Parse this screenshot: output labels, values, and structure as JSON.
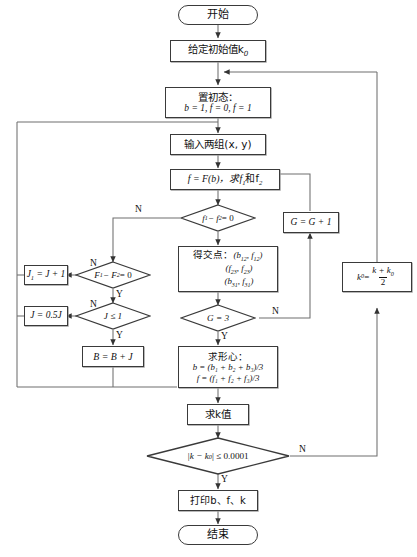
{
  "diagram": {
    "language": "zh-CN",
    "nodes": {
      "start": {
        "label": "开始",
        "shape": "terminator"
      },
      "init_k0": {
        "label": "给定初始值k",
        "sub": "0",
        "shape": "process"
      },
      "init_state_line1": {
        "label": "置初态："
      },
      "init_state_line2": {
        "b": "b = 1",
        "f0": "f = 0",
        "f1": "f = 1"
      },
      "input_pairs": {
        "label": "输入两组(x, y)",
        "shape": "process"
      },
      "calc_f": {
        "label": "f = F(b)，求f",
        "sub1": "1",
        "mid": "和f",
        "sub2": "2",
        "shape": "process"
      },
      "dec_f_diff": {
        "label": "f",
        "sub1": "1",
        "minus": " − f",
        "sub2": "2",
        "tail": " = 0",
        "shape": "decision"
      },
      "dec_F_diff": {
        "label": "F",
        "sub1": "1",
        "minus": " − F",
        "sub2": "2",
        "tail": " = 0",
        "shape": "decision"
      },
      "j_increment": {
        "label": "J",
        "sub": "1",
        "tail": " = J + 1",
        "shape": "process"
      },
      "dec_j_le_1": {
        "label": "J ≤ 1",
        "shape": "decision"
      },
      "j_half": {
        "label": "J = 0.5J",
        "shape": "process"
      },
      "b_plus_j": {
        "label": "B = B + J",
        "shape": "process"
      },
      "intersections": {
        "title": "得交点：",
        "p1": "(b",
        "p1s1": "12",
        "p1m": ", f",
        "p1s2": "12",
        "p1e": ")",
        "p2": "(f",
        "p2s1": "23",
        "p2m": ", f",
        "p2s2": "23",
        "p2e": ")",
        "p3": "(b",
        "p3s1": "31",
        "p3m": ", f",
        "p3s2": "31",
        "p3e": ")",
        "shape": "process"
      },
      "dec_g3": {
        "label": "G = 3",
        "shape": "decision"
      },
      "g_increment": {
        "label": "G = G + 1",
        "shape": "process"
      },
      "centroid": {
        "title": "求形心：",
        "line_b": "b = (b₁ + b₂ + b₃)/3",
        "line_f": "f = (f₁ + f₂ + f₃)/3",
        "shape": "process"
      },
      "calc_k": {
        "label": "求k值",
        "shape": "process"
      },
      "dec_converge": {
        "label": "|k − k",
        "sub": "0",
        "tail": "| ≤ 0.0001",
        "shape": "decision"
      },
      "k0_update": {
        "label": "k",
        "sub": "0",
        "eq": " = ",
        "num": "k + k",
        "numsub": "0",
        "den": "2",
        "shape": "process"
      },
      "print": {
        "label": "打印b、f、k",
        "shape": "process"
      },
      "end": {
        "label": "结束",
        "shape": "terminator"
      }
    },
    "edge_labels": {
      "f_diff_no": "N",
      "F_diff_no": "N",
      "F_diff_yes": "Y",
      "j_le_1_no": "N",
      "j_le_1_yes": "Y",
      "g3_no": "N",
      "g3_yes": "Y",
      "converge_no": "N",
      "converge_yes": "Y"
    },
    "colors": {
      "stroke": "#3a3a3a",
      "wire": "#6e6e6e",
      "text": "#111111",
      "background": "#ffffff"
    }
  }
}
